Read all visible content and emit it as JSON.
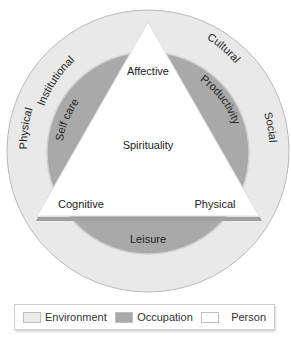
{
  "diagram": {
    "colors": {
      "environment": "#e9e9e9",
      "occupation": "#a9a9a9",
      "person": "#ffffff",
      "outline": "#b5b5b5"
    },
    "environment_labels": {
      "physical": "Physical",
      "institutional": "Institutional",
      "cultural": "Cultural",
      "social": "Social"
    },
    "occupation_labels": {
      "self_care": "Self care",
      "productivity": "Productivity",
      "leisure": "Leisure"
    },
    "person_labels": {
      "affective": "Affective",
      "spirituality": "Spirituality",
      "cognitive": "Cognitive",
      "physical": "Physical"
    }
  },
  "legend": {
    "items": [
      {
        "label": "Environment",
        "color": "#ececec"
      },
      {
        "label": "Occupation",
        "color": "#a9a9a9"
      },
      {
        "label": "Person",
        "color": "#ffffff"
      }
    ]
  }
}
